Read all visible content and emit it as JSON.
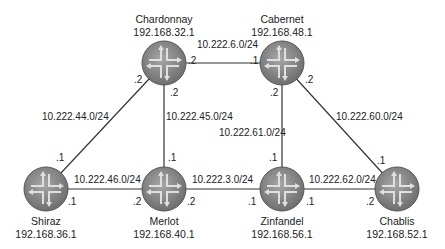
{
  "routers": [
    {
      "id": "chardonnay",
      "name": "Chardonnay",
      "ip": "192.168.32.1",
      "x": 164,
      "y": 63
    },
    {
      "id": "cabernet",
      "name": "Cabernet",
      "ip": "192.168.48.1",
      "x": 282,
      "y": 63
    },
    {
      "id": "shiraz",
      "name": "Shiraz",
      "ip": "192.168.36.1",
      "x": 46,
      "y": 189
    },
    {
      "id": "merlot",
      "name": "Merlot",
      "ip": "192.168.40.1",
      "x": 164,
      "y": 189
    },
    {
      "id": "zinfandel",
      "name": "Zinfandel",
      "ip": "192.168.56.1",
      "x": 282,
      "y": 189
    },
    {
      "id": "chablis",
      "name": "Chablis",
      "ip": "192.168.52.1",
      "x": 397,
      "y": 189
    }
  ],
  "links": [
    {
      "subnet": "10.222.6.0/24",
      "a": "chardonnay",
      "a_if": ".2",
      "b": "cabernet",
      "b_if": ".1"
    },
    {
      "subnet": "10.222.44.0/24",
      "a": "chardonnay",
      "a_if": ".2",
      "b": "shiraz",
      "b_if": ".1"
    },
    {
      "subnet": "10.222.45.0/24",
      "a": "chardonnay",
      "a_if": ".2",
      "b": "merlot",
      "b_if": ".1"
    },
    {
      "subnet": "10.222.61.0/24",
      "a": "cabernet",
      "a_if": ".2",
      "b": "zinfandel",
      "b_if": ".1"
    },
    {
      "subnet": "10.222.60.0/24",
      "a": "cabernet",
      "a_if": ".2",
      "b": "chablis",
      "b_if": ".1"
    },
    {
      "subnet": "10.222.46.0/24",
      "a": "shiraz",
      "a_if": ".1",
      "b": "merlot",
      "b_if": ".2"
    },
    {
      "subnet": "10.222.3.0/24",
      "a": "merlot",
      "a_if": ".2",
      "b": "zinfandel",
      "b_if": ".1"
    },
    {
      "subnet": "10.222.62.0/24",
      "a": "zinfandel",
      "a_if": ".1",
      "b": "chablis",
      "b_if": ".2"
    }
  ],
  "colors": {
    "router_fill": "#8a8a8a",
    "router_edge": "#5a5a5a",
    "arrow": "#d8d8d8",
    "line": "#333333"
  }
}
